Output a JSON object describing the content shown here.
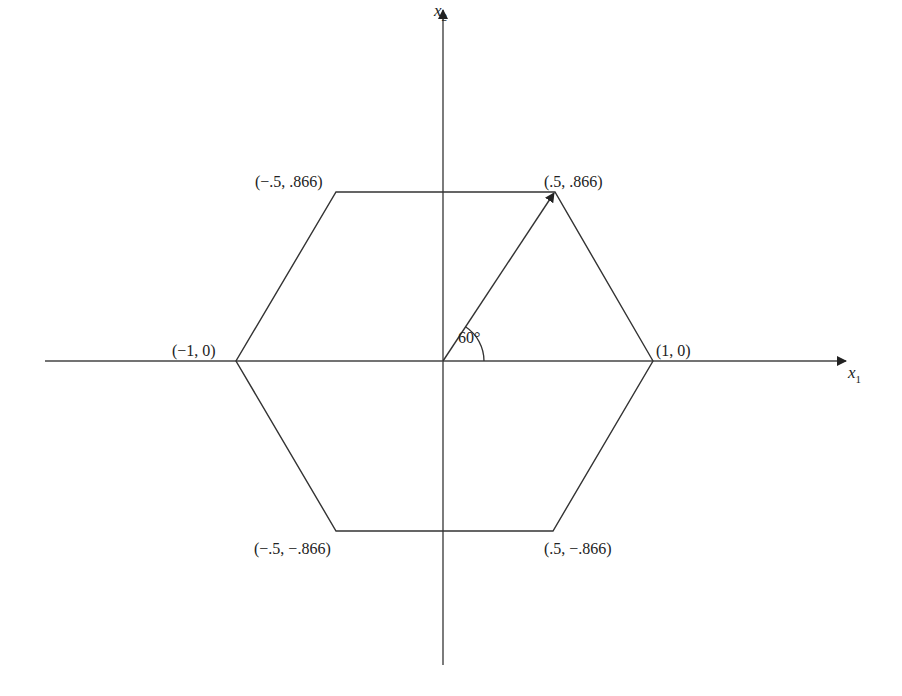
{
  "diagram": {
    "title": "",
    "axes": {
      "x_label": "x",
      "x_sub": "1",
      "y_label": "x",
      "y_sub": "2"
    },
    "angle_label": "60°",
    "vertices": [
      {
        "coord": "(1, 0)",
        "x": 1,
        "y": 0
      },
      {
        "coord": "(.5, .866)",
        "x": 0.5,
        "y": 0.866
      },
      {
        "coord": "(−.5, .866)",
        "x": -0.5,
        "y": 0.866
      },
      {
        "coord": "(−1, 0)",
        "x": -1,
        "y": 0
      },
      {
        "coord": "(−.5, −.866)",
        "x": -0.5,
        "y": -0.866
      },
      {
        "coord": "(.5, −.866)",
        "x": 0.5,
        "y": -0.866
      }
    ],
    "vector": {
      "from": "(0, 0)",
      "to": "(.5, .866)"
    },
    "colors": {
      "line": "#333333",
      "background": "#ffffff"
    }
  }
}
